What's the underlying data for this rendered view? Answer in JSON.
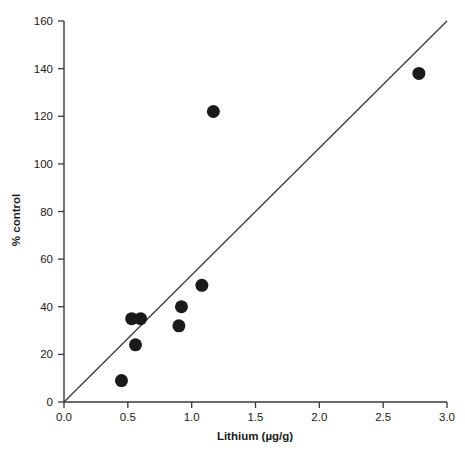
{
  "chart_data": {
    "type": "scatter",
    "title": "",
    "xlabel": "Lithium (µg/g)",
    "ylabel": "% control",
    "xlim": [
      0.0,
      3.0
    ],
    "ylim": [
      0,
      160
    ],
    "grid": false,
    "legend": null,
    "xticks": [
      "0.0",
      "0.5",
      "1.0",
      "1.5",
      "2.0",
      "2.5",
      "3.0"
    ],
    "xtick_values": [
      0.0,
      0.5,
      1.0,
      1.5,
      2.0,
      2.5,
      3.0
    ],
    "yticks": [
      "0",
      "20",
      "40",
      "60",
      "80",
      "100",
      "120",
      "140",
      "160"
    ],
    "ytick_values": [
      0,
      20,
      40,
      60,
      80,
      100,
      120,
      140,
      160
    ],
    "marker": "filled-circle",
    "marker_color": "#1a1a1a",
    "marker_size_px": 13,
    "points": [
      {
        "x": 0.45,
        "y": 9
      },
      {
        "x": 0.53,
        "y": 35
      },
      {
        "x": 0.6,
        "y": 35
      },
      {
        "x": 0.56,
        "y": 24
      },
      {
        "x": 0.9,
        "y": 32
      },
      {
        "x": 0.92,
        "y": 40
      },
      {
        "x": 1.08,
        "y": 49
      },
      {
        "x": 1.17,
        "y": 122
      },
      {
        "x": 2.78,
        "y": 138
      }
    ],
    "reference_line": {
      "label": "1:1 reference line",
      "x_start": 0.0,
      "y_start": 0,
      "x_end": 3.0,
      "y_end": 160,
      "slope": 53.3,
      "intercept": 0,
      "color": "#3a3a3a"
    },
    "axis_color": "#3a3a3a",
    "background": "#ffffff"
  }
}
